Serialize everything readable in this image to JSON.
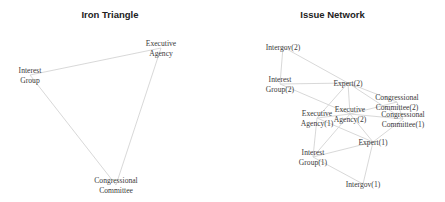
{
  "panels": [
    {
      "title": "Iron Triangle",
      "nodes": [
        {
          "id": "ig",
          "lines": [
            "Interest",
            "Group"
          ],
          "x": 30,
          "y": 75
        },
        {
          "id": "ea",
          "lines": [
            "Executive",
            "Agency"
          ],
          "x": 161,
          "y": 48
        },
        {
          "id": "cc",
          "lines": [
            "Congressional",
            "Committee"
          ],
          "x": 116,
          "y": 185
        }
      ],
      "edges": [
        [
          "ig",
          "ea"
        ],
        [
          "ig",
          "cc"
        ],
        [
          "ea",
          "cc"
        ]
      ]
    },
    {
      "title": "Issue Network",
      "nodes": [
        {
          "id": "intergov2",
          "lines": [
            "Intergov(2)"
          ],
          "x": 63,
          "y": 47
        },
        {
          "id": "ig2",
          "lines": [
            "Interest",
            "Group(2)"
          ],
          "x": 60,
          "y": 84
        },
        {
          "id": "expert2",
          "lines": [
            "Expert(2)"
          ],
          "x": 128,
          "y": 83
        },
        {
          "id": "cc2",
          "lines": [
            "Congressional",
            "Committee(2)"
          ],
          "x": 177,
          "y": 102
        },
        {
          "id": "ea1",
          "lines": [
            "Executive",
            "Agency(1)"
          ],
          "x": 97,
          "y": 118
        },
        {
          "id": "ea2",
          "lines": [
            "Executive",
            "Agency(2)"
          ],
          "x": 130,
          "y": 114
        },
        {
          "id": "cc1",
          "lines": [
            "Congressional",
            "Committee(1)"
          ],
          "x": 183,
          "y": 119
        },
        {
          "id": "expert1",
          "lines": [
            "Expert(1)"
          ],
          "x": 153,
          "y": 142
        },
        {
          "id": "ig1",
          "lines": [
            "Interest",
            "Group(1)"
          ],
          "x": 93,
          "y": 157
        },
        {
          "id": "intergov1",
          "lines": [
            "Intergov(1)"
          ],
          "x": 143,
          "y": 184
        }
      ],
      "edges": [
        [
          "intergov2",
          "ig2"
        ],
        [
          "intergov2",
          "expert2"
        ],
        [
          "ig2",
          "expert2"
        ],
        [
          "ig2",
          "ea2"
        ],
        [
          "expert2",
          "ea1"
        ],
        [
          "expert2",
          "ea2"
        ],
        [
          "expert2",
          "cc2"
        ],
        [
          "expert2",
          "cc1"
        ],
        [
          "ea1",
          "ea2"
        ],
        [
          "ea1",
          "ig1"
        ],
        [
          "ea1",
          "expert1"
        ],
        [
          "ea2",
          "cc2"
        ],
        [
          "ea2",
          "cc1"
        ],
        [
          "ea2",
          "ig1"
        ],
        [
          "ea2",
          "expert1"
        ],
        [
          "cc2",
          "cc1"
        ],
        [
          "cc1",
          "expert1"
        ],
        [
          "expert1",
          "ig1"
        ],
        [
          "expert1",
          "intergov1"
        ],
        [
          "ig1",
          "intergov1"
        ]
      ]
    }
  ]
}
